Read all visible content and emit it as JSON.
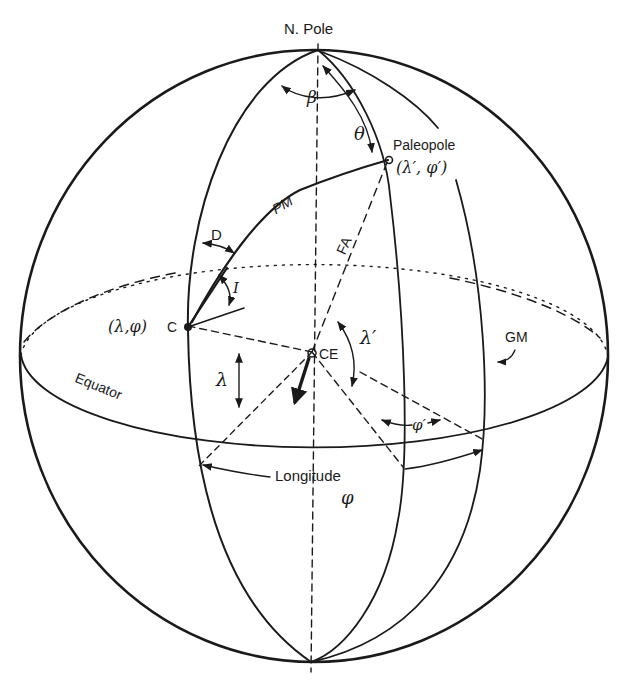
{
  "figure": {
    "background": "#ffffff",
    "ink": "#1a1a1a"
  },
  "labels": {
    "north_pole": "N. Pole",
    "paleopole": "Paleopole",
    "paleopole_coords": "(λ′, φ′)",
    "site": "C",
    "site_coords": "(λ,φ)",
    "center": "CE",
    "pm": "PM",
    "fa": "FA",
    "gm": "GM",
    "equator": "Equator",
    "longitude": "Longitude",
    "phi": "φ",
    "lambda": "λ",
    "lambda_prime": "λ′",
    "phi_prime": "φ′",
    "declination": "D",
    "inclination": "I",
    "beta": "β",
    "theta": "θ"
  }
}
